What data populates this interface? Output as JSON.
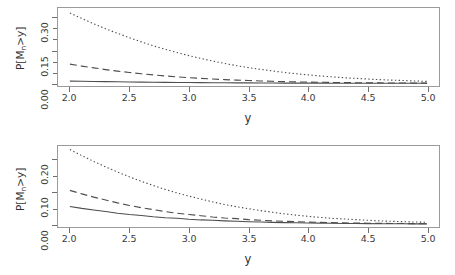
{
  "figure": {
    "background": "#ffffff",
    "axis_color": "#6f6f6f",
    "line_color": "#4d4d4d"
  },
  "chart_data": [
    {
      "id": "top",
      "type": "line",
      "title": "",
      "xlabel": "y",
      "ylabel": "P[Mₙ>y]",
      "ylabel_base": "P[M",
      "ylabel_sub": "n",
      "ylabel_tail": ">y]",
      "xlim": [
        1.9,
        5.1
      ],
      "ylim": [
        -0.012,
        0.345
      ],
      "grid": false,
      "legend": "none",
      "xticks": [
        2.0,
        2.5,
        3.0,
        3.5,
        4.0,
        4.5,
        5.0
      ],
      "xticklabels": [
        "2.0",
        "2.5",
        "3.0",
        "3.5",
        "4.0",
        "4.5",
        "5.0"
      ],
      "yticks": [
        0.0,
        0.15,
        0.3
      ],
      "yticklabels": [
        "0.00",
        "0.15",
        "0.30"
      ],
      "yminorticks": [
        0.05,
        0.1,
        0.2,
        0.25
      ],
      "x": [
        2.0,
        2.1,
        2.2,
        2.3,
        2.4,
        2.5,
        2.6,
        2.7,
        2.8,
        2.9,
        3.0,
        3.1,
        3.2,
        3.3,
        3.4,
        3.5,
        3.6,
        3.7,
        3.8,
        3.9,
        4.0,
        4.1,
        4.2,
        4.3,
        4.4,
        4.5,
        4.6,
        4.7,
        4.8,
        4.9,
        5.0
      ],
      "series": [
        {
          "name": "dotted",
          "style": "dotted",
          "values": [
            0.322,
            0.297,
            0.273,
            0.25,
            0.229,
            0.209,
            0.19,
            0.172,
            0.156,
            0.141,
            0.127,
            0.114,
            0.102,
            0.091,
            0.081,
            0.072,
            0.064,
            0.057,
            0.05,
            0.044,
            0.039,
            0.034,
            0.03,
            0.026,
            0.023,
            0.02,
            0.017,
            0.015,
            0.013,
            0.011,
            0.009
          ]
        },
        {
          "name": "dashed",
          "style": "dashed",
          "values": [
            0.088,
            0.079,
            0.071,
            0.063,
            0.056,
            0.05,
            0.044,
            0.039,
            0.034,
            0.03,
            0.026,
            0.023,
            0.02,
            0.017,
            0.015,
            0.013,
            0.011,
            0.0095,
            0.0081,
            0.0069,
            0.0059,
            0.005,
            0.0042,
            0.0036,
            0.003,
            0.0025,
            0.0021,
            0.0018,
            0.0015,
            0.0013,
            0.0011
          ]
        },
        {
          "name": "solid",
          "style": "solid",
          "values": [
            0.0105,
            0.0096,
            0.0088,
            0.008,
            0.0072,
            0.0066,
            0.0059,
            0.0053,
            0.0048,
            0.0043,
            0.0038,
            0.0034,
            0.003,
            0.0027,
            0.0024,
            0.0021,
            0.0018,
            0.0016,
            0.0014,
            0.0012,
            0.0011,
            0.00094,
            0.00082,
            0.00071,
            0.00062,
            0.00054,
            0.00047,
            0.00041,
            0.00035,
            0.00031,
            0.00027
          ]
        }
      ]
    },
    {
      "id": "bottom",
      "type": "line",
      "title": "",
      "xlabel": "y",
      "ylabel": "P[Mₙ>y]",
      "ylabel_base": "P[M",
      "ylabel_sub": "n",
      "ylabel_tail": ">y]",
      "xlim": [
        1.9,
        5.1
      ],
      "ylim": [
        -0.009,
        0.243
      ],
      "grid": false,
      "legend": "none",
      "xticks": [
        2.0,
        2.5,
        3.0,
        3.5,
        4.0,
        4.5,
        5.0
      ],
      "xticklabels": [
        "2.0",
        "2.5",
        "3.0",
        "3.5",
        "4.0",
        "4.5",
        "5.0"
      ],
      "yticks": [
        0.0,
        0.1,
        0.2
      ],
      "yticklabels": [
        "0.00",
        "0.10",
        "0.20"
      ],
      "yminorticks": [
        0.05,
        0.15
      ],
      "x": [
        2.0,
        2.1,
        2.2,
        2.3,
        2.4,
        2.5,
        2.6,
        2.7,
        2.8,
        2.9,
        3.0,
        3.1,
        3.2,
        3.3,
        3.4,
        3.5,
        3.6,
        3.7,
        3.8,
        3.9,
        4.0,
        4.1,
        4.2,
        4.3,
        4.4,
        4.5,
        4.6,
        4.7,
        4.8,
        4.9,
        5.0
      ],
      "series": [
        {
          "name": "dotted",
          "style": "dotted",
          "values": [
            0.232,
            0.213,
            0.195,
            0.178,
            0.162,
            0.147,
            0.133,
            0.12,
            0.108,
            0.097,
            0.087,
            0.078,
            0.069,
            0.061,
            0.054,
            0.048,
            0.042,
            0.037,
            0.032,
            0.028,
            0.024,
            0.021,
            0.018,
            0.016,
            0.014,
            0.012,
            0.01,
            0.0088,
            0.0076,
            0.0065,
            0.0056
          ]
        },
        {
          "name": "dashed",
          "style": "dashed",
          "values": [
            0.105,
            0.094,
            0.084,
            0.075,
            0.066,
            0.058,
            0.051,
            0.045,
            0.039,
            0.034,
            0.03,
            0.026,
            0.022,
            0.019,
            0.017,
            0.014,
            0.012,
            0.01,
            0.0088,
            0.0075,
            0.0064,
            0.0054,
            0.0046,
            0.0039,
            0.0033,
            0.0028,
            0.0023,
            0.002,
            0.0017,
            0.0014,
            0.0012
          ]
        },
        {
          "name": "solid",
          "style": "solid",
          "values": [
            0.055,
            0.049,
            0.044,
            0.039,
            0.034,
            0.03,
            0.027,
            0.023,
            0.02,
            0.018,
            0.015,
            0.013,
            0.012,
            0.01,
            0.0087,
            0.0075,
            0.0064,
            0.0055,
            0.0047,
            0.004,
            0.0034,
            0.0029,
            0.0025,
            0.0021,
            0.0018,
            0.0015,
            0.0013,
            0.0011,
            0.00092,
            0.00078,
            0.00067
          ]
        }
      ]
    }
  ]
}
